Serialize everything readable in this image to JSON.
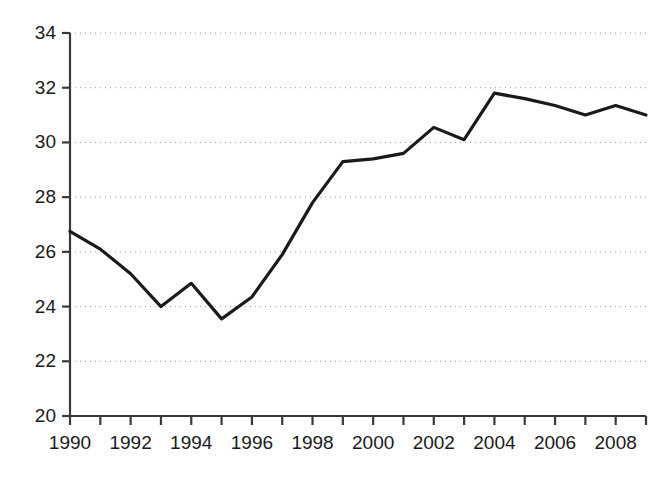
{
  "chart_data": {
    "type": "line",
    "title": "",
    "subtitle": "",
    "xlabel": "",
    "ylabel": "",
    "x": [
      1990,
      1991,
      1992,
      1993,
      1994,
      1995,
      1996,
      1997,
      1998,
      1999,
      2000,
      2001,
      2002,
      2003,
      2004,
      2005,
      2006,
      2007,
      2008,
      2009
    ],
    "values": [
      26.75,
      26.1,
      25.2,
      24.0,
      24.85,
      23.55,
      24.35,
      25.9,
      27.8,
      29.3,
      29.4,
      29.6,
      30.55,
      30.1,
      31.8,
      31.6,
      31.35,
      31.0,
      31.35,
      31.0
    ],
    "series": [
      {
        "name": "series-1",
        "color": "#1a1a1a",
        "values": [
          26.75,
          26.1,
          25.2,
          24.0,
          24.85,
          23.55,
          24.35,
          25.9,
          27.8,
          29.3,
          29.4,
          29.6,
          30.55,
          30.1,
          31.8,
          31.6,
          31.35,
          31.0,
          31.35,
          31.0
        ]
      }
    ],
    "xlim": [
      1990,
      2009
    ],
    "ylim": [
      20,
      34
    ],
    "y_ticks": [
      20,
      22,
      24,
      26,
      28,
      30,
      32,
      34
    ],
    "y_tick_labels": [
      "20",
      "22",
      "24",
      "26",
      "28",
      "30",
      "32",
      "34"
    ],
    "x_ticks": [
      1990,
      1991,
      1992,
      1993,
      1994,
      1995,
      1996,
      1997,
      1998,
      1999,
      2000,
      2001,
      2002,
      2003,
      2004,
      2005,
      2006,
      2007,
      2008,
      2009
    ],
    "x_tick_labels": [
      "1990",
      "",
      "1992",
      "",
      "1994",
      "",
      "1996",
      "",
      "1998",
      "",
      "2000",
      "",
      "2002",
      "",
      "2004",
      "",
      "2006",
      "",
      "2008",
      ""
    ],
    "grid": {
      "horizontal": true,
      "vertical": false,
      "style": "dotted",
      "color": "#9a9a9a"
    },
    "legend": {
      "visible": false,
      "position": "none"
    },
    "axis_color": "#3a3a3a",
    "background": "#ffffff"
  }
}
